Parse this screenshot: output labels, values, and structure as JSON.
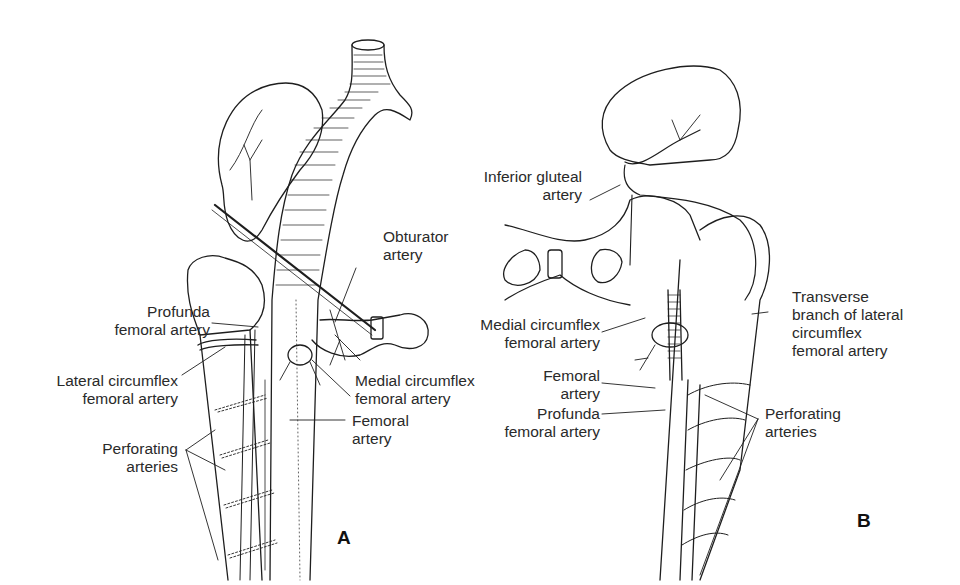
{
  "figure": {
    "panels": [
      {
        "id": "A",
        "letter": "A",
        "labels": {
          "obturator": "Obturator\nartery",
          "profunda": "Profunda\nfemoral artery",
          "lateral_circumflex": "Lateral circumflex\nfemoral artery",
          "medial_circumflex": "Medial circumflex\nfemoral artery",
          "femoral": "Femoral\nartery",
          "perforating": "Perforating\narteries"
        }
      },
      {
        "id": "B",
        "letter": "B",
        "labels": {
          "inferior_gluteal": "Inferior gluteal\nartery",
          "medial_circumflex": "Medial circumflex\nfemoral artery",
          "transverse_branch": "Transverse\nbranch of lateral\ncircumflex\nfemoral artery",
          "femoral": "Femoral\nartery",
          "profunda": "Profunda\nfemoral artery",
          "perforating": "Perforating\narteries"
        }
      }
    ],
    "colors": {
      "line": "#1e1e1e",
      "background": "#ffffff"
    }
  }
}
